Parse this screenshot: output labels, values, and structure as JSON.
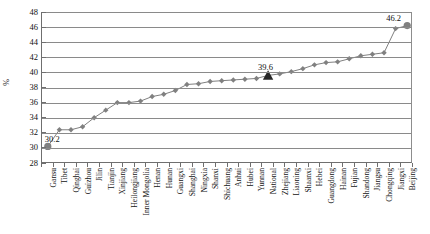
{
  "chart_data": {
    "type": "line",
    "title": "",
    "xlabel": "",
    "ylabel": "%",
    "ylim": [
      28,
      48
    ],
    "ytick_step": 2,
    "yticks": [
      48,
      46,
      44,
      42,
      40,
      38,
      36,
      34,
      32,
      30,
      28
    ],
    "grid": true,
    "legend": null,
    "marker": "diamond",
    "series_color": "#808080",
    "highlight_color": "#262626",
    "categories": [
      "Gansu",
      "Tibet",
      "Qinghai",
      "Guizhou",
      "Jilin",
      "Tianjin",
      "Xinjiang",
      "Heilongjiang",
      "Inner Mongolia",
      "Henan",
      "Hunan",
      "Guangxi",
      "Shanghai",
      "Ningxia",
      "Shanxi",
      "Shichuang",
      "Anhui",
      "Hubei",
      "Yunnan",
      "National",
      "Zhejiang",
      "Liaoning",
      "Shaanxi",
      "Hebei",
      "Guangdong",
      "Hainan",
      "Fujian",
      "Shandong",
      "Jiangsu",
      "Chongqing",
      "Jiangxi",
      "Beijing"
    ],
    "values": [
      30.2,
      32.4,
      32.4,
      32.8,
      34.0,
      35.0,
      36.0,
      36.0,
      36.2,
      36.8,
      37.1,
      37.6,
      38.4,
      38.5,
      38.8,
      38.9,
      39.0,
      39.1,
      39.2,
      39.6,
      39.8,
      40.1,
      40.5,
      41.0,
      41.3,
      41.4,
      41.8,
      42.2,
      42.4,
      42.6,
      45.8,
      46.2
    ],
    "annotations": [
      {
        "category": "Gansu",
        "value": 30.2,
        "text": "30.2"
      },
      {
        "category": "National",
        "value": 39.6,
        "text": "39.6"
      },
      {
        "category": "Beijing",
        "value": 46.2,
        "text": "46.2"
      }
    ],
    "emphasized": [
      {
        "category": "Gansu",
        "marker": "circle-large"
      },
      {
        "category": "National",
        "marker": "triangle-dark"
      },
      {
        "category": "Beijing",
        "marker": "circle-large"
      }
    ]
  }
}
